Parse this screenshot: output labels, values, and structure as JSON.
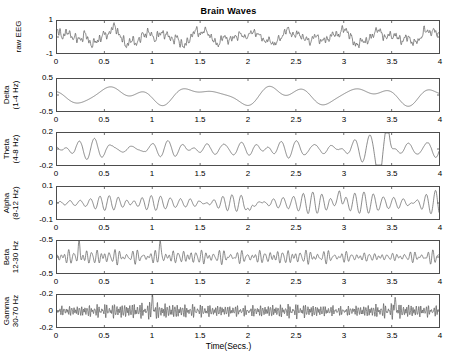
{
  "figure": {
    "title": "Brain Waves",
    "xlabel": "Time(Secs.)",
    "line_color": "#595959",
    "axis_color": "#4d4d4d",
    "background": "#ffffff"
  },
  "chart_data": {
    "type": "line",
    "title": "Brain Waves",
    "xlabel": "Time(Secs.)",
    "ylabel": "",
    "grid": false,
    "legend": "none",
    "xlim": [
      0,
      4
    ],
    "xticks": [
      0,
      0.5,
      1,
      1.5,
      2,
      2.5,
      3,
      3.5,
      4
    ],
    "xticklabels": [
      "0",
      "0.5",
      "1",
      "1.5",
      "2",
      "2.5",
      "3",
      "3.5",
      "4"
    ],
    "subplots": [
      {
        "name": "raw-eeg",
        "ylabel_lines": [
          "raw EEG"
        ],
        "ylim": [
          -1,
          1
        ],
        "yticks": [
          -1,
          0,
          1
        ],
        "yticklabels": [
          "-1",
          "0",
          "1"
        ],
        "band_hz": [
          0.5,
          70
        ],
        "seed": 11,
        "components": [
          {
            "freq": 2.1,
            "amp": 0.3,
            "phase": 0.4
          },
          {
            "freq": 3.3,
            "amp": 0.18,
            "phase": 1.9
          },
          {
            "freq": 6.2,
            "amp": 0.14,
            "phase": 2.7
          },
          {
            "freq": 10.4,
            "amp": 0.11,
            "phase": 0.9
          },
          {
            "freq": 19.7,
            "amp": 0.13,
            "phase": 3.3
          },
          {
            "freq": 31.5,
            "amp": 0.1,
            "phase": 1.2
          },
          {
            "freq": 48.0,
            "amp": 0.08,
            "phase": 5.1
          }
        ],
        "noise": 0.17,
        "envelope": [
          1.0,
          1.05,
          1.0,
          0.95,
          0.75,
          0.8,
          0.95,
          0.85,
          0.95
        ]
      },
      {
        "name": "delta",
        "ylabel_lines": [
          "Delta",
          "(1-4 Hz)"
        ],
        "ylim": [
          -0.5,
          0.5
        ],
        "yticks": [
          -0.5,
          0,
          0.5
        ],
        "yticklabels": [
          "-0.5",
          "0",
          "0.5"
        ],
        "band_hz": [
          1,
          4
        ],
        "seed": 23,
        "components": [
          {
            "freq": 1.15,
            "amp": 0.19,
            "phase": 3.3
          },
          {
            "freq": 2.35,
            "amp": 0.13,
            "phase": 0.7
          },
          {
            "freq": 3.1,
            "amp": 0.07,
            "phase": 2.2
          }
        ],
        "noise": 0.0,
        "envelope": [
          0.9,
          1.0,
          0.85,
          1.0,
          1.05,
          0.9,
          1.1,
          0.85,
          1.0
        ]
      },
      {
        "name": "theta",
        "ylabel_lines": [
          "Theta",
          "(4-8 Hz)"
        ],
        "ylim": [
          -0.2,
          0.2
        ],
        "yticks": [
          -0.2,
          0,
          0.2
        ],
        "yticklabels": [
          "-0.2",
          "0",
          "0.2"
        ],
        "band_hz": [
          4,
          8
        ],
        "seed": 37,
        "components": [
          {
            "freq": 5.2,
            "amp": 0.055,
            "phase": 1.1
          },
          {
            "freq": 6.6,
            "amp": 0.045,
            "phase": 4.0
          },
          {
            "freq": 7.6,
            "amp": 0.03,
            "phase": 2.5
          }
        ],
        "noise": 0.006,
        "envelope": [
          0.8,
          1.2,
          0.8,
          0.9,
          0.85,
          1.0,
          1.1,
          1.6,
          1.0
        ],
        "transient": {
          "time": 3.38,
          "width": 0.035,
          "amp": -0.3
        },
        "transient2": {
          "time": 3.46,
          "width": 0.03,
          "amp": 0.26
        }
      },
      {
        "name": "alpha",
        "ylabel_lines": [
          "Alpha",
          "(8-12 Hz)"
        ],
        "ylim": [
          -0.1,
          0.1
        ],
        "yticks": [
          -0.1,
          0,
          0.1
        ],
        "yticklabels": [
          "-0.1",
          "0",
          "0.1"
        ],
        "band_hz": [
          8,
          12
        ],
        "seed": 53,
        "components": [
          {
            "freq": 9.4,
            "amp": 0.022,
            "phase": 0.3
          },
          {
            "freq": 10.8,
            "amp": 0.02,
            "phase": 2.8
          },
          {
            "freq": 11.7,
            "amp": 0.012,
            "phase": 5.0
          }
        ],
        "noise": 0.004,
        "envelope": [
          0.75,
          0.95,
          1.1,
          0.9,
          1.0,
          1.6,
          1.3,
          1.7,
          1.5
        ],
        "transient": {
          "time": 2.02,
          "width": 0.022,
          "amp": -0.075
        },
        "transient2": {
          "time": 2.96,
          "width": 0.022,
          "amp": 0.072
        }
      },
      {
        "name": "beta",
        "ylabel_lines": [
          "Beta",
          "12-30 Hz"
        ],
        "ylim": [
          -0.5,
          0.5
        ],
        "yticks": [
          -0.5,
          0,
          0.5
        ],
        "yticklabels": [
          "-0.5",
          "0",
          "-0.5"
        ],
        "band_hz": [
          12,
          30
        ],
        "seed": 71,
        "components": [
          {
            "freq": 16.5,
            "amp": 0.085,
            "phase": 1.7
          },
          {
            "freq": 21.0,
            "amp": 0.075,
            "phase": 3.6
          },
          {
            "freq": 26.5,
            "amp": 0.055,
            "phase": 0.2
          }
        ],
        "noise": 0.02,
        "envelope": [
          1.1,
          1.3,
          1.0,
          1.2,
          1.0,
          1.25,
          0.9,
          0.6,
          1.2
        ],
        "transient": {
          "time": 1.08,
          "width": 0.012,
          "amp": 0.42
        },
        "transient2": {
          "time": 0.23,
          "width": 0.012,
          "amp": 0.4
        }
      },
      {
        "name": "gamma",
        "ylabel_lines": [
          "Gamma",
          "30-70 Hz"
        ],
        "ylim": [
          -0.2,
          0.2
        ],
        "yticks": [
          -0.2,
          0,
          0.2
        ],
        "yticklabels": [
          "-0.2",
          "0",
          "-0.2"
        ],
        "band_hz": [
          30,
          70
        ],
        "seed": 97,
        "components": [
          {
            "freq": 38.0,
            "amp": 0.03,
            "phase": 2.1
          },
          {
            "freq": 49.0,
            "amp": 0.028,
            "phase": 4.4
          },
          {
            "freq": 62.0,
            "amp": 0.02,
            "phase": 0.8
          }
        ],
        "noise": 0.012,
        "envelope": [
          0.8,
          1.2,
          1.5,
          1.1,
          0.95,
          1.3,
          0.8,
          1.4,
          0.9
        ],
        "transient": {
          "time": 1.0,
          "width": 0.008,
          "amp": 0.19
        },
        "transient2": {
          "time": 3.54,
          "width": 0.008,
          "amp": 0.19
        }
      }
    ]
  },
  "layout": {
    "plot_left": 56,
    "plot_width": 384,
    "panel_tops": [
      20,
      78,
      132,
      186,
      240,
      294
    ],
    "panel_height": 34
  }
}
